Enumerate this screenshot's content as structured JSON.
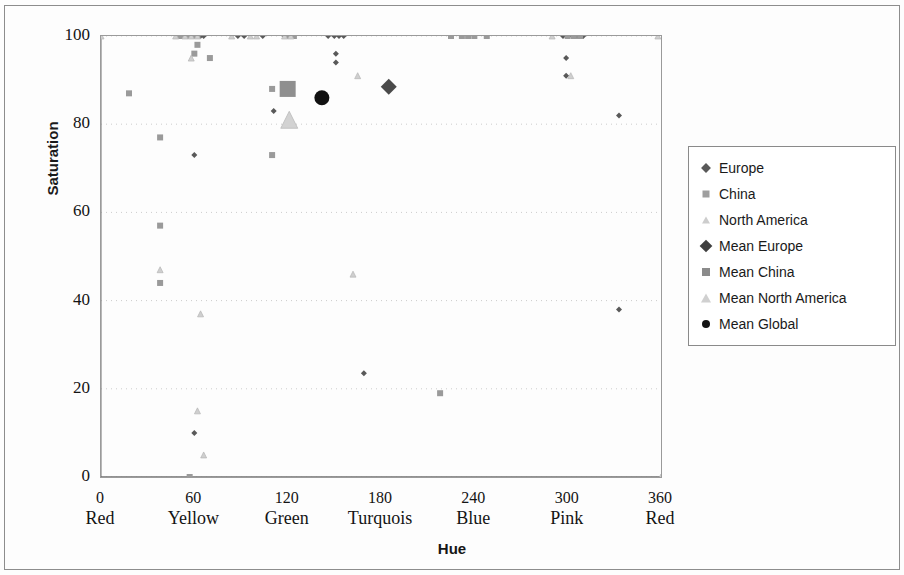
{
  "chart_data": {
    "type": "scatter",
    "title": "",
    "xlabel": "Hue",
    "ylabel": "Saturation",
    "xlim": [
      0,
      360
    ],
    "ylim": [
      0,
      100
    ],
    "xticks": [
      0,
      60,
      120,
      180,
      240,
      300,
      360
    ],
    "xtick_names": [
      "Red",
      "Yellow",
      "Green",
      "Turquois",
      "Blue",
      "Pink",
      "Red"
    ],
    "yticks": [
      0,
      20,
      40,
      60,
      80,
      100
    ],
    "grid": "horizontal-dotted",
    "legend_position": "right",
    "colors": {
      "europe": "#595959",
      "china": "#9a9a9a",
      "north_america": "#cfcfcf",
      "mean_europe": "#4a4a4a",
      "mean_china": "#8f8f8f",
      "mean_north_america": "#d2d2d2",
      "mean_global": "#111111",
      "grid": "#cccccc",
      "axis": "#8a8a8a"
    },
    "series": [
      {
        "name": "Europe",
        "marker": "diamond",
        "color": "#595959",
        "size": 6,
        "points": [
          [
            52,
            100
          ],
          [
            56,
            100
          ],
          [
            60,
            100
          ],
          [
            64,
            100
          ],
          [
            66,
            100
          ],
          [
            88,
            100
          ],
          [
            92,
            100
          ],
          [
            104,
            100
          ],
          [
            118,
            100
          ],
          [
            146,
            100
          ],
          [
            150,
            100
          ],
          [
            153,
            100
          ],
          [
            156,
            100
          ],
          [
            297,
            100
          ],
          [
            300,
            100
          ],
          [
            303,
            100
          ],
          [
            306,
            100
          ],
          [
            310,
            100
          ],
          [
            60,
            73
          ],
          [
            111,
            83
          ],
          [
            151,
            96
          ],
          [
            151,
            94
          ],
          [
            299,
            95
          ],
          [
            299,
            91
          ],
          [
            333,
            82
          ],
          [
            333,
            38
          ],
          [
            169,
            23.5
          ],
          [
            60,
            10
          ]
        ]
      },
      {
        "name": "China",
        "marker": "square",
        "color": "#9a9a9a",
        "size": 6,
        "points": [
          [
            50,
            100
          ],
          [
            53,
            100
          ],
          [
            57,
            100
          ],
          [
            60,
            100
          ],
          [
            62,
            100
          ],
          [
            120,
            100
          ],
          [
            122,
            100
          ],
          [
            124,
            100
          ],
          [
            225,
            100
          ],
          [
            232,
            100
          ],
          [
            236,
            100
          ],
          [
            240,
            100
          ],
          [
            248,
            100
          ],
          [
            300,
            100
          ],
          [
            304,
            100
          ],
          [
            308,
            100
          ],
          [
            62,
            98
          ],
          [
            60,
            96
          ],
          [
            70,
            95
          ],
          [
            18,
            87
          ],
          [
            110,
            88
          ],
          [
            38,
            77
          ],
          [
            110,
            73
          ],
          [
            38,
            57
          ],
          [
            38,
            44
          ],
          [
            218,
            19
          ],
          [
            57,
            0
          ]
        ]
      },
      {
        "name": "North America",
        "marker": "triangle",
        "color": "#cfcfcf",
        "size": 6,
        "points": [
          [
            48,
            100
          ],
          [
            54,
            100
          ],
          [
            58,
            100
          ],
          [
            62,
            100
          ],
          [
            84,
            100
          ],
          [
            96,
            100
          ],
          [
            100,
            100
          ],
          [
            118,
            100
          ],
          [
            122,
            100
          ],
          [
            290,
            100
          ],
          [
            58,
            95
          ],
          [
            165,
            91
          ],
          [
            302,
            91
          ],
          [
            38,
            47
          ],
          [
            64,
            37
          ],
          [
            162,
            46
          ],
          [
            62,
            15
          ],
          [
            66,
            5
          ],
          [
            358,
            100
          ],
          [
            0,
            100
          ],
          [
            360,
            0
          ]
        ]
      },
      {
        "name": "Mean Europe",
        "marker": "diamond",
        "color": "#4a4a4a",
        "size": 16,
        "points": [
          [
            185,
            88.5
          ]
        ]
      },
      {
        "name": "Mean China",
        "marker": "square",
        "color": "#8f8f8f",
        "size": 16,
        "points": [
          [
            120,
            88
          ]
        ]
      },
      {
        "name": "Mean North America",
        "marker": "triangle",
        "color": "#d2d2d2",
        "size": 17,
        "points": [
          [
            121,
            81
          ]
        ]
      },
      {
        "name": "Mean Global",
        "marker": "circle",
        "color": "#111111",
        "size": 15,
        "points": [
          [
            142,
            86
          ]
        ]
      }
    ]
  },
  "axes": {
    "y_title": "Saturation",
    "x_title": "Hue",
    "y_tick_labels": [
      "100",
      "80",
      "60",
      "40",
      "20",
      "0"
    ],
    "x_tick_numbers": [
      "0",
      "60",
      "120",
      "180",
      "240",
      "300",
      "360"
    ],
    "x_tick_names": [
      "Red",
      "Yellow",
      "Green",
      "Turquois",
      "Blue",
      "Pink",
      "Red"
    ]
  },
  "legend": {
    "items": [
      {
        "label": "Europe",
        "marker": "diamond",
        "color": "#595959",
        "size": 7
      },
      {
        "label": "China",
        "marker": "square",
        "color": "#9f9f9f",
        "size": 7
      },
      {
        "label": "North America",
        "marker": "triangle",
        "color": "#cdcdcd",
        "size": 7
      },
      {
        "label": "Mean Europe",
        "marker": "diamond",
        "color": "#3f3f3f",
        "size": 9
      },
      {
        "label": "Mean China",
        "marker": "square",
        "color": "#8b8b8b",
        "size": 8
      },
      {
        "label": "Mean North America",
        "marker": "triangle",
        "color": "#d0d0d0",
        "size": 9
      },
      {
        "label": "Mean Global",
        "marker": "circle",
        "color": "#141414",
        "size": 8
      }
    ]
  }
}
